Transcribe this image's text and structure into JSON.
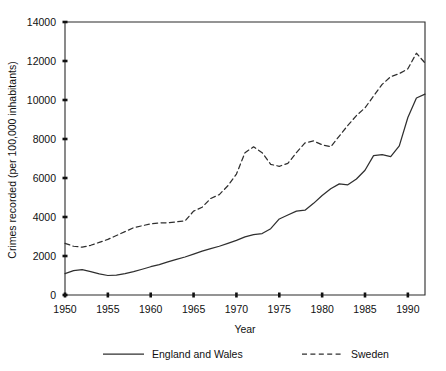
{
  "chart_data": {
    "type": "line",
    "title": "",
    "xlabel": "Year",
    "ylabel": "Crimes recorded (per 100,000 inhabitants)",
    "xlim": [
      1950,
      1992
    ],
    "ylim": [
      0,
      14000
    ],
    "grid": false,
    "legend_position": "bottom",
    "x_ticks": [
      1950,
      1955,
      1960,
      1965,
      1970,
      1975,
      1980,
      1985,
      1990
    ],
    "y_ticks": [
      0,
      2000,
      4000,
      6000,
      8000,
      10000,
      12000,
      14000
    ],
    "x": [
      1950,
      1951,
      1952,
      1953,
      1954,
      1955,
      1956,
      1957,
      1958,
      1959,
      1960,
      1961,
      1962,
      1963,
      1964,
      1965,
      1966,
      1967,
      1968,
      1969,
      1970,
      1971,
      1972,
      1973,
      1974,
      1975,
      1976,
      1977,
      1978,
      1979,
      1980,
      1981,
      1982,
      1983,
      1984,
      1985,
      1986,
      1987,
      1988,
      1989,
      1990,
      1991,
      1992
    ],
    "series": [
      {
        "name": "England and Wales",
        "style": "solid",
        "color": "#2f2f2f",
        "values": [
          1100,
          1250,
          1300,
          1200,
          1080,
          1000,
          1020,
          1100,
          1200,
          1320,
          1450,
          1560,
          1700,
          1830,
          1950,
          2100,
          2250,
          2380,
          2500,
          2650,
          2800,
          2980,
          3100,
          3150,
          3400,
          3900,
          4100,
          4300,
          4350,
          4700,
          5100,
          5450,
          5700,
          5650,
          5950,
          6400,
          7150,
          7200,
          7100,
          7650,
          9100,
          10100,
          10300
        ]
      },
      {
        "name": "Sweden",
        "style": "dashed",
        "color": "#2f2f2f",
        "values": [
          2650,
          2500,
          2450,
          2550,
          2700,
          2850,
          3050,
          3250,
          3450,
          3550,
          3650,
          3700,
          3700,
          3750,
          3800,
          4300,
          4500,
          4950,
          5150,
          5600,
          6200,
          7300,
          7600,
          7300,
          6700,
          6600,
          6750,
          7300,
          7800,
          7900,
          7700,
          7600,
          8150,
          8700,
          9200,
          9600,
          10200,
          10800,
          11200,
          11350,
          11600,
          12400,
          11900
        ]
      }
    ]
  },
  "legend": {
    "items": [
      {
        "label": "England and Wales",
        "style": "solid"
      },
      {
        "label": "Sweden",
        "style": "dashed"
      }
    ]
  }
}
